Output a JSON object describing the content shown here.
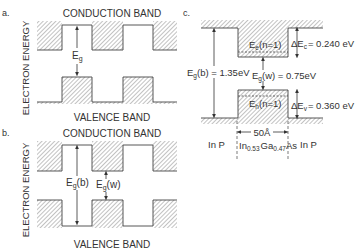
{
  "panel_a": {
    "label": "a.",
    "top_title": "CONDUCTION BAND",
    "bottom_title": "VALENCE BAND",
    "axis_label": "ELECTRON ENERGY",
    "gap_symbol": "E",
    "gap_sub": "g"
  },
  "panel_b": {
    "label": "b.",
    "top_title": "CONDUCTION BAND",
    "bottom_title": "VALENCE BAND",
    "axis_label": "ELECTRON ENERGY",
    "barrier_gap": {
      "symbol": "E",
      "sub": "g",
      "suffix": "(b)"
    },
    "well_gap": {
      "symbol": "E",
      "sub": "g",
      "suffix": "(w)"
    }
  },
  "panel_c": {
    "label": "c.",
    "electron_level": {
      "symbol": "E",
      "sub": "e",
      "suffix": "(n=1)"
    },
    "hole_level": {
      "symbol": "E",
      "sub": "h",
      "suffix": "(n=1)"
    },
    "barrier_gap": {
      "symbol": "E",
      "sub": "g",
      "suffix": "(b) = 1.35eV"
    },
    "well_gap": {
      "symbol": "E",
      "sub": "g",
      "suffix": "(w) = 0.75eV"
    },
    "conduction_offset": {
      "symbol": "ΔE",
      "sub": "c",
      "suffix": "= 0.240 eV"
    },
    "valence_offset": {
      "symbol": "ΔE",
      "sub": "v",
      "suffix": "= 0.360 eV"
    },
    "well_width": "50Å",
    "left_material": "In P",
    "right_material": "In P",
    "well_material": {
      "in": "In",
      "in_sub": "0.53",
      "ga": "Ga",
      "ga_sub": "0.47",
      "as": "As"
    }
  }
}
